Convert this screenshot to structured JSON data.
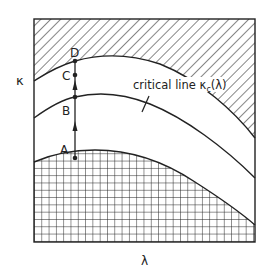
{
  "diagram": {
    "type": "phase-diagram",
    "axes": {
      "y_label": "κ",
      "x_label": "λ"
    },
    "regions": [
      {
        "name": "upper-hatched-region",
        "pattern": "diagonal-hatch"
      },
      {
        "name": "middle-band",
        "pattern": "none"
      },
      {
        "name": "lower-band",
        "pattern": "none"
      },
      {
        "name": "lower-crosshatched-region",
        "pattern": "grid-crosshatch"
      }
    ],
    "curves": {
      "critical_line_label": "critical line ",
      "critical_line_symbol": "κ",
      "critical_line_subscript": "c",
      "critical_line_arg": "(λ)"
    },
    "points": [
      {
        "label": "A"
      },
      {
        "label": "B"
      },
      {
        "label": "C"
      },
      {
        "label": "D"
      }
    ],
    "colors": {
      "ink": "#222222",
      "background": "#ffffff"
    }
  }
}
